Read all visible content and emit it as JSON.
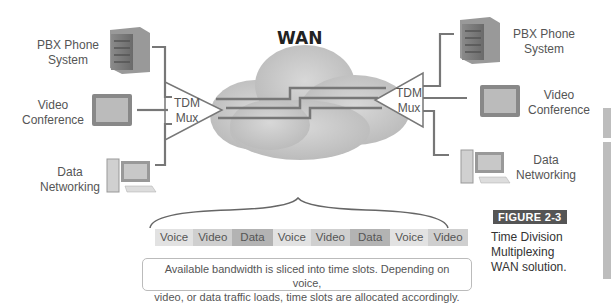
{
  "figure": {
    "tag": "FIGURE 2-3",
    "description_lines": [
      "Time Division",
      "Multiplexing",
      "WAN solution."
    ]
  },
  "network": {
    "center_label": "WAN",
    "left_mux": {
      "line1": "TDM",
      "line2": "Mux"
    },
    "right_mux": {
      "line1": "TDM",
      "line2": "Mux"
    },
    "left_devices": [
      {
        "line1": "PBX Phone",
        "line2": "System",
        "icon": "server-icon"
      },
      {
        "line1": "Video",
        "line2": "Conference",
        "icon": "monitor-icon"
      },
      {
        "line1": "Data",
        "line2": "Networking",
        "icon": "desktop-computer-icon"
      }
    ],
    "right_devices": [
      {
        "line1": "PBX Phone",
        "line2": "System",
        "icon": "server-icon"
      },
      {
        "line1": "Video",
        "line2": "Conference",
        "icon": "monitor-icon"
      },
      {
        "line1": "Data",
        "line2": "Networking",
        "icon": "desktop-computer-icon"
      }
    ]
  },
  "time_slots": [
    {
      "label": "Voice",
      "color": "#e2e2e2"
    },
    {
      "label": "Video",
      "color": "#cfcfcf"
    },
    {
      "label": "Data",
      "color": "#b3b3b3"
    },
    {
      "label": "Voice",
      "color": "#e2e2e2"
    },
    {
      "label": "Video",
      "color": "#cfcfcf"
    },
    {
      "label": "Data",
      "color": "#b3b3b3"
    },
    {
      "label": "Voice",
      "color": "#e2e2e2"
    },
    {
      "label": "Video",
      "color": "#cfcfcf"
    }
  ],
  "caption": {
    "line1": "Available bandwidth is sliced into time slots. Depending on voice,",
    "line2": "video, or data traffic loads, time slots are allocated accordingly."
  }
}
